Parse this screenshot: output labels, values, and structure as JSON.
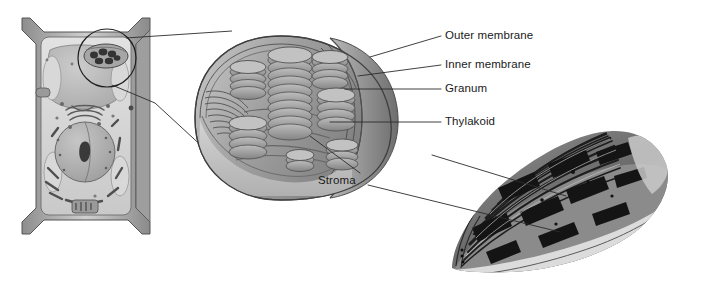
{
  "figure": {
    "panels": [
      {
        "id": "plant-cell",
        "name": "plant cell illustration",
        "caption": ""
      },
      {
        "id": "chloroplast-cutaway",
        "name": "chloroplast cutaway illustration",
        "caption": ""
      },
      {
        "id": "chloroplast-micrograph",
        "name": "chloroplast transmission electron micrograph",
        "caption": ""
      }
    ]
  },
  "labels": [
    {
      "key": "outer_membrane",
      "text": "Outer membrane",
      "x": 445,
      "y": 36
    },
    {
      "key": "inner_membrane",
      "text": "Inner membrane",
      "x": 445,
      "y": 65
    },
    {
      "key": "granum",
      "text": "Granum",
      "x": 445,
      "y": 89
    },
    {
      "key": "thylakoid",
      "text": "Thylakoid",
      "x": 445,
      "y": 122
    },
    {
      "key": "stroma",
      "text": "Stroma",
      "x": 318,
      "y": 181
    }
  ],
  "colors": {
    "background": "#ffffff",
    "ink": "#1a1a1a",
    "leader_line": "#2b2b2b",
    "cell_wall": "#9a9a9a",
    "cytoplasm": "#d6d6d6",
    "vacuole": "#bdbdbd",
    "nucleus": "#b4b4b4",
    "nucleolus": "#3a3a3a",
    "organelle": "#8e8e8e",
    "chloroplast_body": "#a8a8a8",
    "chloroplast_envelope": "#8a8a8a",
    "granum_disc": "#9d9d9d",
    "stroma_fill": "#c4c4c4",
    "micrograph_dark": "#2a2a2a",
    "micrograph_mid": "#6f6f6f",
    "micrograph_light": "#b9b9b9"
  }
}
